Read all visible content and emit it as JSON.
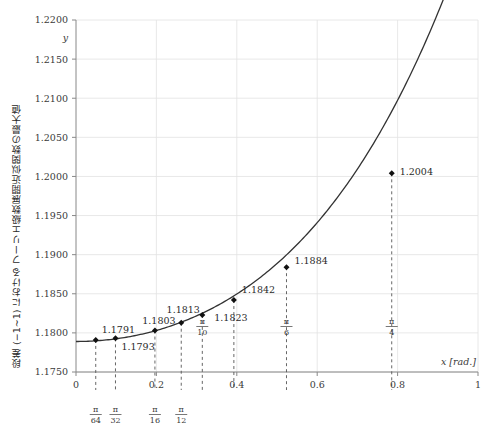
{
  "chart_data": {
    "type": "line",
    "title": "",
    "xlabel": "x [rad.]",
    "ylabel": "y",
    "ylabel_vertical": "段差 (−1~1) における フーリエ級数展開近似関数の最大値",
    "xlim": [
      0,
      1
    ],
    "ylim": [
      1.175,
      1.22
    ],
    "grid": true,
    "legend": "none",
    "x_ticks": [
      "0",
      "0.2",
      "0.4",
      "0.6",
      "0.8",
      "1"
    ],
    "x_tick_values": [
      0,
      0.2,
      0.4,
      0.6,
      0.8,
      1
    ],
    "y_ticks": [
      "1.1750",
      "1.1800",
      "1.1850",
      "1.1900",
      "1.1950",
      "1.2000",
      "1.2050",
      "1.2100",
      "1.2150",
      "1.2200"
    ],
    "y_tick_values": [
      1.175,
      1.18,
      1.185,
      1.19,
      1.195,
      1.2,
      1.205,
      1.21,
      1.215,
      1.22
    ],
    "series": [
      {
        "name": "max of Fourier partial sum",
        "x": [
          0.0491,
          0.0982,
          0.1963,
          0.2618,
          0.3142,
          0.3927,
          0.5236,
          0.7854
        ],
        "values": [
          1.1791,
          1.1793,
          1.1803,
          1.1813,
          1.1823,
          1.1842,
          1.1884,
          1.2004
        ],
        "point_labels": [
          "1.1791",
          "1.1793",
          "1.1803",
          "1.1813",
          "1.1823",
          "1.1842",
          "1.1884",
          "1.2004"
        ],
        "x_fraction_labels": [
          "π/64",
          "π/32",
          "π/16",
          "π/12",
          "π/10",
          "π/4",
          "π/6",
          ""
        ]
      }
    ],
    "fraction_ticks": [
      {
        "num": "π",
        "den": "64",
        "x": 0.0491,
        "inside": false
      },
      {
        "num": "π",
        "den": "32",
        "x": 0.0982,
        "inside": false
      },
      {
        "num": "π",
        "den": "16",
        "x": 0.1963,
        "inside": false
      },
      {
        "num": "π",
        "den": "12",
        "x": 0.2618,
        "inside": false
      },
      {
        "num": "π",
        "den": "10",
        "x": 0.3142,
        "inside": true
      },
      {
        "num": "π",
        "den": "6",
        "x": 0.5236,
        "inside": true
      },
      {
        "num": "π",
        "den": "4",
        "x": 0.7854,
        "inside": true
      }
    ],
    "colors": {
      "curve": "#333333",
      "marker": "#111111",
      "grid": "#e2e2e2",
      "axis": "#888888",
      "dropline": "#555555",
      "background": "#ffffff"
    }
  }
}
